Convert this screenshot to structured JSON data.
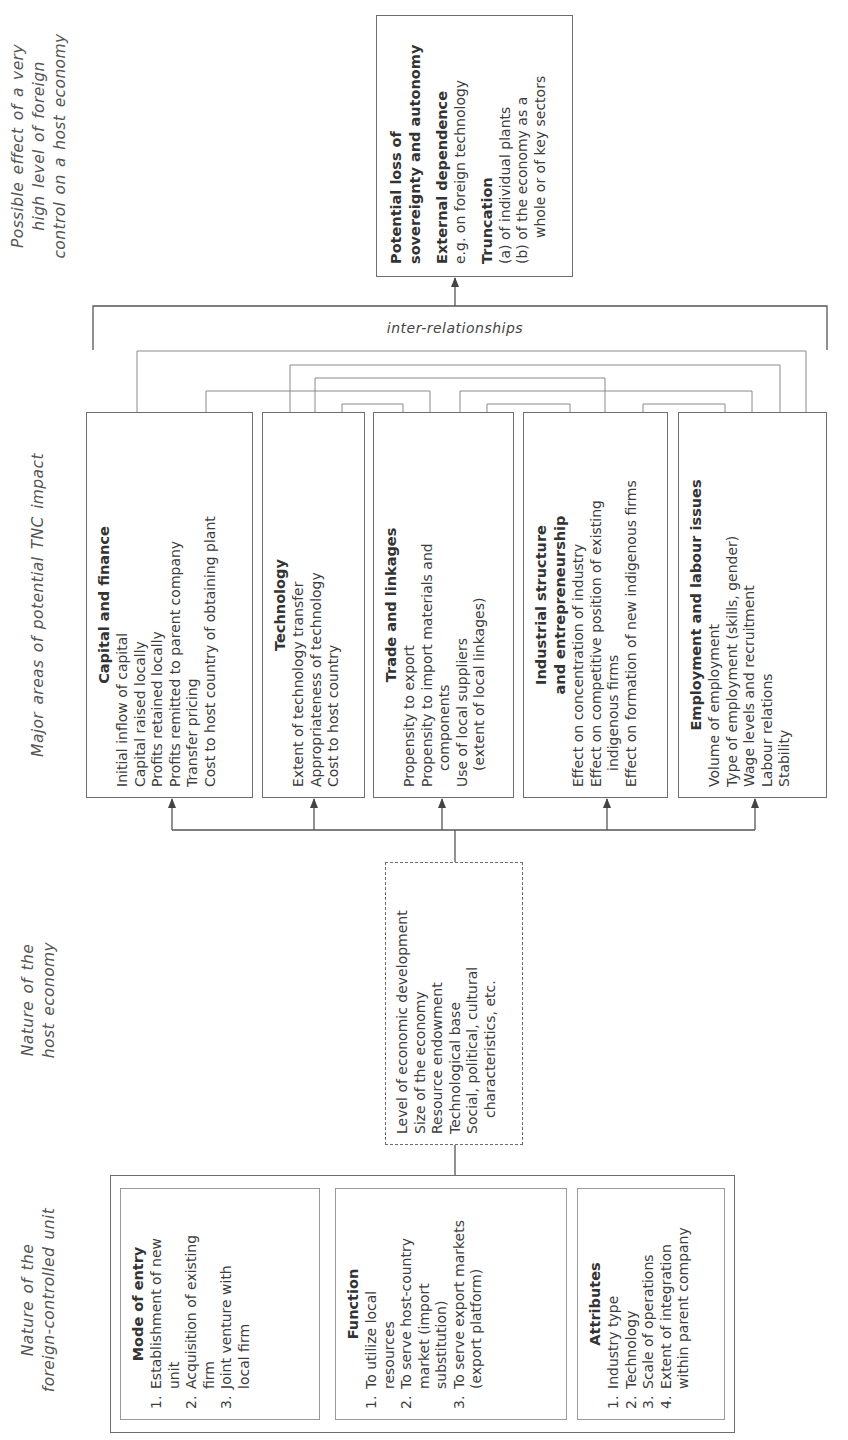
{
  "column_titles": {
    "foreign_unit": [
      "Nature of the",
      "foreign-controlled unit"
    ],
    "host_economy": [
      "Nature of the",
      "host economy"
    ],
    "tnc_impact": [
      "Major areas of potential TNC impact"
    ],
    "possible_effect": [
      "Possible effect of a very",
      "high level of foreign",
      "control on a host economy"
    ]
  },
  "foreign_unit": {
    "mode_of_entry": {
      "title": "Mode of entry",
      "items": [
        {
          "num": "1.",
          "lines": [
            "Establishment of new",
            "unit"
          ]
        },
        {
          "num": "2.",
          "lines": [
            "Acquisition of existing",
            "firm"
          ]
        },
        {
          "num": "3.",
          "lines": [
            "Joint venture with",
            "local firm"
          ]
        }
      ]
    },
    "function": {
      "title": "Function",
      "items": [
        {
          "num": "1.",
          "lines": [
            "To utilize local",
            "resources"
          ]
        },
        {
          "num": "2.",
          "lines": [
            "To serve host-country",
            "market (import",
            "substitution)"
          ]
        },
        {
          "num": "3.",
          "lines": [
            "To serve export markets",
            "(export platform)"
          ]
        }
      ]
    },
    "attributes": {
      "title": "Attributes",
      "items": [
        {
          "num": "1.",
          "lines": [
            "Industry type"
          ]
        },
        {
          "num": "2.",
          "lines": [
            "Technology"
          ]
        },
        {
          "num": "3.",
          "lines": [
            "Scale of operations"
          ]
        },
        {
          "num": "4.",
          "lines": [
            "Extent of integration",
            "within parent company"
          ]
        }
      ]
    }
  },
  "host_economy": {
    "items": [
      "Level of economic development",
      "Size of the economy",
      "Resource endowment",
      "Technological base",
      "Social, political, cultural",
      "characteristics, etc."
    ]
  },
  "tnc_impact": {
    "capital": {
      "title": [
        "Capital and finance"
      ],
      "items": [
        "Initial inflow of capital",
        "Capital raised locally",
        "Profits retained locally",
        "Profits remitted to parent company",
        "Transfer pricing",
        "Cost to host country of obtaining plant"
      ]
    },
    "technology": {
      "title": [
        "Technology"
      ],
      "items": [
        "Extent of technology transfer",
        "Appropriateness of technology",
        "Cost to host country"
      ]
    },
    "trade": {
      "title": [
        "Trade and linkages"
      ],
      "items": [
        "Propensity to export",
        "Propensity to import materials and",
        "components",
        "Use of local suppliers",
        "(extent of local linkages)"
      ]
    },
    "industrial": {
      "title": [
        "Industrial structure",
        "and entrepreneurship"
      ],
      "items": [
        "Effect on concentration of industry",
        "Effect on competitive position of existing",
        "indigenous firms",
        "Effect on formation of new indigenous firms"
      ]
    },
    "employment": {
      "title": [
        "Employment and labour issues"
      ],
      "items": [
        "Volume of employment",
        "Type of employment (skills, gender)",
        "Wage levels and recruitment",
        "Labour relations",
        "Stability"
      ]
    }
  },
  "connectors": {
    "inter_label": "inter-relationships"
  },
  "possible_effect": {
    "sovereignty": {
      "title": [
        "Potential loss of",
        "sovereignty and autonomy"
      ]
    },
    "external": {
      "title": "External dependence",
      "lines": [
        "e.g. on foreign technology"
      ]
    },
    "truncation": {
      "title": "Truncation",
      "lines": [
        "(a) of individual plants",
        "(b) of the economy as a",
        "whole or of key sectors"
      ]
    }
  }
}
